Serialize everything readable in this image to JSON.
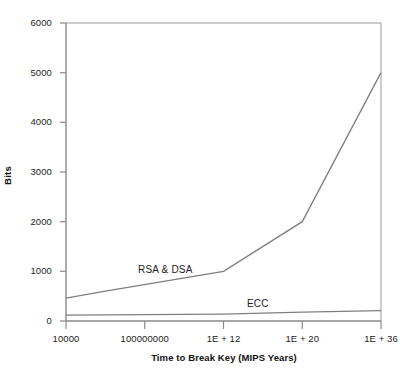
{
  "chart_data": {
    "type": "line",
    "title": "",
    "xlabel": "Time to Break Key (MIPS Years)",
    "ylabel": "Bits",
    "x_tick_labels": [
      "10000",
      "100000000",
      "1E + 12",
      "1E + 20",
      "1E + 36"
    ],
    "y_tick_labels": [
      "0",
      "1000",
      "2000",
      "3000",
      "4000",
      "5000",
      "6000"
    ],
    "ylim": [
      0,
      6000
    ],
    "y_ticks": [
      0,
      1000,
      2000,
      3000,
      4000,
      5000,
      6000
    ],
    "grid": false,
    "legend_position": "inline-annotation",
    "axis_color": "#808080",
    "line_color": "#808080",
    "series": [
      {
        "name": "RSA & DSA",
        "annotation": "RSA & DSA",
        "points": [
          {
            "x_label": "10000",
            "x_index": 0,
            "value": 460
          },
          {
            "x_label": "10000000",
            "x_index": 0.5,
            "value": 600
          },
          {
            "x_label": "1E + 12",
            "x_index": 2,
            "value": 1000
          },
          {
            "x_label": "1E + 20",
            "x_index": 3,
            "value": 2000
          },
          {
            "x_label": "1E + 36",
            "x_index": 4,
            "value": 5000
          }
        ],
        "values": [
          460,
          600,
          1000,
          2000,
          5000
        ]
      },
      {
        "name": "ECC",
        "annotation": "ECC",
        "points": [
          {
            "x_label": "10000",
            "x_index": 0,
            "value": 120
          },
          {
            "x_label": "1E + 12",
            "x_index": 2,
            "value": 140
          },
          {
            "x_label": "1E + 20",
            "x_index": 3,
            "value": 180
          },
          {
            "x_label": "1E + 36",
            "x_index": 4,
            "value": 210
          }
        ],
        "values": [
          120,
          140,
          180,
          210
        ]
      }
    ]
  },
  "axis": {
    "y_title": "Bits",
    "x_title": "Time to Break Key (MIPS Years)",
    "y_ticks": [
      {
        "label": "6000"
      },
      {
        "label": "5000"
      },
      {
        "label": "4000"
      },
      {
        "label": "3000"
      },
      {
        "label": "2000"
      },
      {
        "label": "1000"
      },
      {
        "label": "0"
      }
    ],
    "x_ticks": [
      {
        "label": "10000"
      },
      {
        "label": "100000000"
      },
      {
        "label": "1E + 12"
      },
      {
        "label": "1E + 20"
      },
      {
        "label": "1E + 36"
      }
    ]
  },
  "annotations": {
    "rsa_dsa": "RSA & DSA",
    "ecc": "ECC"
  }
}
